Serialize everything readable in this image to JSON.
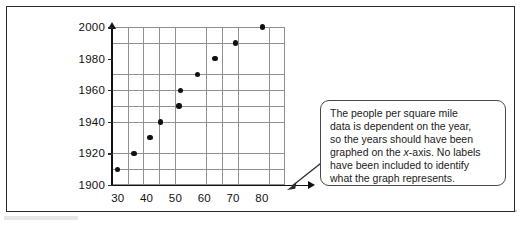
{
  "figure": {
    "frame_color": "#2b2b2b",
    "background": "#ffffff"
  },
  "chart_data": {
    "type": "scatter",
    "title": "",
    "xlabel": "",
    "ylabel": "",
    "xlim": [
      28,
      88
    ],
    "ylim": [
      1900,
      2000
    ],
    "xticks": [
      "30",
      "40",
      "50",
      "60",
      "70",
      "80"
    ],
    "xtick_values": [
      30,
      40,
      50,
      60,
      70,
      80
    ],
    "yticks": [
      "1900",
      "1920",
      "1940",
      "1960",
      "1980",
      "2000"
    ],
    "ytick_values": [
      1900,
      1920,
      1940,
      1960,
      1980,
      2000
    ],
    "grid": true,
    "legend": null,
    "marker": "filled-circle",
    "marker_color": "#111111",
    "x": [
      30.0,
      35.6,
      41.2,
      44.9,
      51.2,
      51.8,
      57.7,
      63.7,
      70.8,
      80.1
    ],
    "y": [
      1910,
      1920,
      1930,
      1940,
      1950,
      1960,
      1970,
      1980,
      1990,
      2000
    ],
    "points": [
      {
        "x": 30.0,
        "y": 1910
      },
      {
        "x": 35.6,
        "y": 1920
      },
      {
        "x": 41.2,
        "y": 1930
      },
      {
        "x": 44.9,
        "y": 1940
      },
      {
        "x": 51.2,
        "y": 1950
      },
      {
        "x": 51.8,
        "y": 1960
      },
      {
        "x": 57.7,
        "y": 1970
      },
      {
        "x": 63.7,
        "y": 1980
      },
      {
        "x": 70.8,
        "y": 1990
      },
      {
        "x": 80.1,
        "y": 2000
      }
    ]
  },
  "callout": {
    "line1": "The people per square mile",
    "line2": "data is dependent on the year,",
    "line3": "so the years should have been",
    "line4_pre": "graphed on the ",
    "line4_italic": "x",
    "line4_post": "-axis. No labels",
    "line5": "have been included to identify",
    "line6": "what the graph represents."
  }
}
